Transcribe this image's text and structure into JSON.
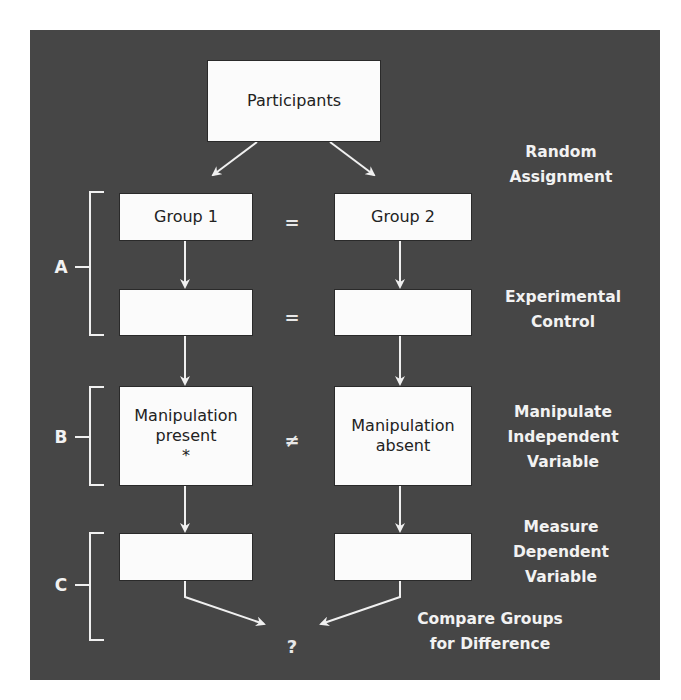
{
  "diagram": {
    "title_box": {
      "label": "Participants"
    },
    "left_column": {
      "group": "Group 1",
      "control": "",
      "manipulation": [
        "Manipulation",
        "present",
        "*"
      ],
      "measure": ""
    },
    "right_column": {
      "group": "Group 2",
      "control": "",
      "manipulation": [
        "Manipulation",
        "absent"
      ],
      "measure": ""
    },
    "relations": {
      "group_relation": "=",
      "control_relation": "=",
      "manipulation_relation": "≠",
      "outcome": "?"
    },
    "step_labels": {
      "random_assignment": [
        "Random",
        "Assignment"
      ],
      "experimental_control": [
        "Experimental",
        "Control"
      ],
      "manipulate_iv": [
        "Manipulate",
        "Independent",
        "Variable"
      ],
      "measure_dv": [
        "Measure",
        "Dependent",
        "Variable"
      ],
      "compare": [
        "Compare Groups",
        "for Difference"
      ]
    },
    "brackets": [
      {
        "letter": "A"
      },
      {
        "letter": "B"
      },
      {
        "letter": "C"
      }
    ],
    "colors": {
      "panel": "#464646",
      "box": "#fbfbfb",
      "lines": "#f0f0f0",
      "text_light": "#f2f2f2",
      "text_dark": "#222222"
    }
  }
}
